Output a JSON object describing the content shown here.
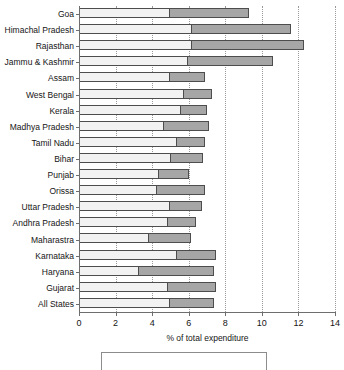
{
  "chart_data": {
    "type": "bar",
    "orientation": "horizontal",
    "stacked": true,
    "title": "",
    "xlabel": "% of total expenditure",
    "ylabel": "",
    "xlim": [
      0,
      14
    ],
    "xticks": [
      0,
      2,
      4,
      6,
      8,
      10,
      12,
      14
    ],
    "xtick_labels": [
      "0",
      "2",
      "4",
      "6",
      "8",
      "10",
      "12",
      "14"
    ],
    "grid": "vertical-dotted",
    "legend_position": "bottom",
    "legend_entries": [],
    "categories": [
      "Goa",
      "Himachal Pradesh",
      "Rajasthan",
      "Jammu & Kashmir",
      "Assam",
      "West Bengal",
      "Kerala",
      "Madhya Pradesh",
      "Tamil Nadu",
      "Bihar",
      "Punjab",
      "Orissa",
      "Uttar Pradesh",
      "Andhra Pradesh",
      "Maharastra",
      "Karnataka",
      "Haryana",
      "Gujarat",
      "All States"
    ],
    "series": [
      {
        "name": "segment-light",
        "color": "#f2f2f2",
        "values": [
          4.9,
          6.1,
          6.1,
          5.9,
          4.9,
          5.7,
          5.5,
          4.6,
          5.3,
          5.0,
          4.3,
          4.2,
          4.9,
          4.8,
          3.8,
          5.3,
          3.2,
          4.8,
          4.9
        ]
      },
      {
        "name": "segment-dark",
        "color": "#a6a6a6",
        "values": [
          4.4,
          5.5,
          6.2,
          4.7,
          2.0,
          1.6,
          1.5,
          2.5,
          1.6,
          1.8,
          1.7,
          2.7,
          1.8,
          1.6,
          2.3,
          2.2,
          4.2,
          2.7,
          2.5
        ]
      }
    ],
    "totals": [
      9.3,
      11.6,
      12.3,
      10.6,
      6.9,
      7.3,
      7.0,
      7.1,
      6.9,
      6.8,
      6.0,
      6.9,
      6.7,
      6.4,
      6.1,
      7.5,
      7.4,
      7.5,
      7.4
    ]
  }
}
